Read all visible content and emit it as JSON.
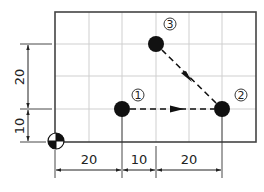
{
  "diagram": {
    "type": "cnc-coordinate-path",
    "units_per_grid": 10,
    "origin": {
      "x": 0,
      "y": 0,
      "symbol": "origin-quadrant-symbol"
    },
    "points": [
      {
        "id": 1,
        "label": "①",
        "x": 20,
        "y": 10
      },
      {
        "id": 2,
        "label": "②",
        "x": 50,
        "y": 10
      },
      {
        "id": 3,
        "label": "③",
        "x": 30,
        "y": 30
      }
    ],
    "path": [
      {
        "from": 1,
        "to": 2,
        "style": "dashed-arrow"
      },
      {
        "from": 2,
        "to": 3,
        "style": "dashed-arrow"
      }
    ],
    "dimensions": {
      "horizontal": [
        {
          "label": "20",
          "from": 0,
          "to": 20
        },
        {
          "label": "10",
          "from": 20,
          "to": 30
        },
        {
          "label": "20",
          "from": 30,
          "to": 50
        }
      ],
      "vertical": [
        {
          "label": "10",
          "from": 0,
          "to": 10
        },
        {
          "label": "20",
          "from": 10,
          "to": 30
        }
      ]
    },
    "colors": {
      "frame": "#444444",
      "grid": "#cfcfcf",
      "point": "#111111",
      "dimension": "#222222"
    }
  }
}
